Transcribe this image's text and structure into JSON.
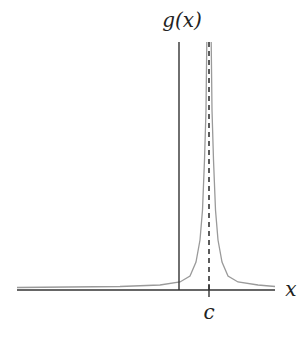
{
  "figure": {
    "function_label": "g(x)",
    "x_axis_label": "x",
    "asymptote_label": "c"
  },
  "colors": {
    "axis": "#333333",
    "curve": "#9a9a9a",
    "asymptote": "#333333",
    "text": "#222222",
    "background": "#ffffff"
  },
  "geometry": {
    "x_axis": {
      "x1": 17,
      "x2": 275,
      "y": 290
    },
    "y_axis": {
      "x": 179,
      "y1": 42,
      "y2": 290
    },
    "asymptote_x": 209,
    "asymptote_top": 42
  }
}
